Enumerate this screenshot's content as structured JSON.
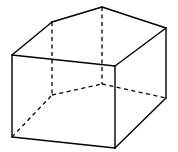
{
  "figure": {
    "type": "pentagonal-prism",
    "stroke_color": "#000000",
    "background": "#ffffff",
    "vertices": {
      "A": [
        12,
        55
      ],
      "B": [
        52,
        22
      ],
      "C": [
        102,
        7
      ],
      "D": [
        166,
        28
      ],
      "E": [
        115,
        66
      ],
      "A1": [
        12,
        137
      ],
      "B1": [
        52,
        95
      ],
      "C1": [
        102,
        84
      ],
      "D1": [
        166,
        98
      ],
      "E1": [
        115,
        148
      ]
    },
    "visible_edges": [
      [
        "A",
        "B"
      ],
      [
        "B",
        "C"
      ],
      [
        "C",
        "D"
      ],
      [
        "D",
        "E"
      ],
      [
        "E",
        "A"
      ],
      [
        "A",
        "A1"
      ],
      [
        "E",
        "E1"
      ],
      [
        "D",
        "D1"
      ],
      [
        "A1",
        "E1"
      ],
      [
        "E1",
        "D1"
      ]
    ],
    "hidden_edges": [
      [
        "B",
        "B1"
      ],
      [
        "C",
        "C1"
      ],
      [
        "A1",
        "B1"
      ],
      [
        "B1",
        "C1"
      ],
      [
        "C1",
        "D1"
      ]
    ]
  }
}
